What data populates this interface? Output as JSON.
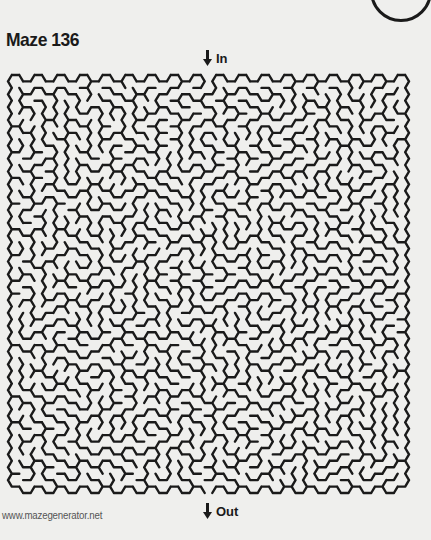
{
  "page": {
    "title": "Maze 136",
    "entrance_label": "In",
    "exit_label": "Out",
    "footer_url": "www.mazegenerator.net"
  },
  "icons": {
    "entrance": "arrow-down-icon",
    "exit": "arrow-down-icon",
    "corner": "circle-outline-icon"
  },
  "maze": {
    "style": "hexagonal",
    "columns": 35,
    "rows": 32,
    "wall_color": "#1a1a1a",
    "background_color": "#efefed",
    "bounds": {
      "left": 8,
      "top": 75,
      "right": 409,
      "bottom": 493
    }
  }
}
